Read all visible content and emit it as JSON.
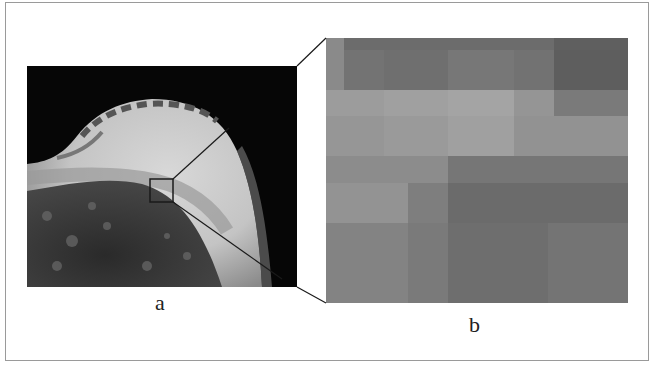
{
  "figure": {
    "panels": [
      {
        "id": "a",
        "label": "a",
        "description": "Breast MRI slice with a small square region of interest marked"
      },
      {
        "id": "b",
        "label": "b",
        "description": "Magnified view of the marked region showing blocky pixel intensities"
      }
    ],
    "zoom_box": {
      "x": 150,
      "y": 179,
      "width": 23,
      "height": 23
    },
    "colors": {
      "frame_border": "#9a9a9a",
      "connector_line": "#1a1a1a",
      "background": "#ffffff"
    },
    "panel_b_blocks": [
      {
        "x": 0,
        "y": 0,
        "w": 18,
        "h": 52,
        "c": "#8a8a8a"
      },
      {
        "x": 18,
        "y": 0,
        "w": 210,
        "h": 12,
        "c": "#6c6c6c"
      },
      {
        "x": 228,
        "y": 0,
        "w": 74,
        "h": 12,
        "c": "#5f5f5f"
      },
      {
        "x": 18,
        "y": 12,
        "w": 40,
        "h": 40,
        "c": "#737373"
      },
      {
        "x": 58,
        "y": 12,
        "w": 64,
        "h": 40,
        "c": "#6f6f6f"
      },
      {
        "x": 122,
        "y": 12,
        "w": 66,
        "h": 40,
        "c": "#777777"
      },
      {
        "x": 188,
        "y": 12,
        "w": 40,
        "h": 40,
        "c": "#727272"
      },
      {
        "x": 228,
        "y": 12,
        "w": 74,
        "h": 40,
        "c": "#5e5e5e"
      },
      {
        "x": 0,
        "y": 52,
        "w": 58,
        "h": 26,
        "c": "#9c9c9c"
      },
      {
        "x": 58,
        "y": 52,
        "w": 64,
        "h": 26,
        "c": "#a0a0a0"
      },
      {
        "x": 122,
        "y": 52,
        "w": 66,
        "h": 26,
        "c": "#a4a4a4"
      },
      {
        "x": 188,
        "y": 52,
        "w": 40,
        "h": 26,
        "c": "#959595"
      },
      {
        "x": 228,
        "y": 52,
        "w": 74,
        "h": 26,
        "c": "#7a7a7a"
      },
      {
        "x": 0,
        "y": 78,
        "w": 58,
        "h": 40,
        "c": "#969696"
      },
      {
        "x": 58,
        "y": 78,
        "w": 64,
        "h": 40,
        "c": "#9a9a9a"
      },
      {
        "x": 122,
        "y": 78,
        "w": 66,
        "h": 40,
        "c": "#a0a0a0"
      },
      {
        "x": 188,
        "y": 78,
        "w": 114,
        "h": 40,
        "c": "#929292"
      },
      {
        "x": 0,
        "y": 118,
        "w": 122,
        "h": 27,
        "c": "#8c8c8c"
      },
      {
        "x": 122,
        "y": 118,
        "w": 180,
        "h": 27,
        "c": "#767676"
      },
      {
        "x": 0,
        "y": 145,
        "w": 82,
        "h": 40,
        "c": "#939393"
      },
      {
        "x": 82,
        "y": 145,
        "w": 40,
        "h": 40,
        "c": "#7e7e7e"
      },
      {
        "x": 122,
        "y": 145,
        "w": 180,
        "h": 40,
        "c": "#6b6b6b"
      },
      {
        "x": 0,
        "y": 185,
        "w": 82,
        "h": 80,
        "c": "#838383"
      },
      {
        "x": 82,
        "y": 185,
        "w": 40,
        "h": 80,
        "c": "#7a7a7a"
      },
      {
        "x": 122,
        "y": 185,
        "w": 100,
        "h": 80,
        "c": "#6e6e6e"
      },
      {
        "x": 222,
        "y": 185,
        "w": 80,
        "h": 80,
        "c": "#747474"
      }
    ]
  }
}
